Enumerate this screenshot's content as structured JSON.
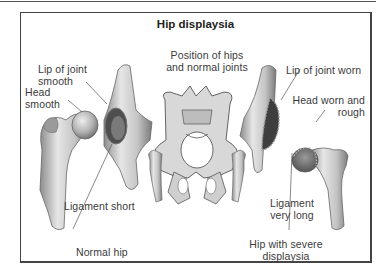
{
  "figure": {
    "title": "Hip displaysia",
    "center_caption": [
      "Position of hips",
      "and normal joints"
    ],
    "left_panel": {
      "caption": "Normal hip",
      "labels": {
        "lip": [
          "Lip of joint",
          "smooth"
        ],
        "head": [
          "Head",
          "smooth"
        ],
        "ligament": "Ligament short"
      }
    },
    "right_panel": {
      "caption": [
        "Hip with severe",
        "displaysia"
      ],
      "labels": {
        "lip": "Lip of joint worn",
        "head": [
          "Head worn and",
          "rough"
        ],
        "ligament": [
          "Ligament",
          "very long"
        ]
      }
    },
    "colors": {
      "frame": "#444444",
      "bone_light": "#e8e8e8",
      "bone_mid": "#b5b5b5",
      "bone_dark": "#6e6e6e",
      "text": "#3a3a3a"
    }
  }
}
